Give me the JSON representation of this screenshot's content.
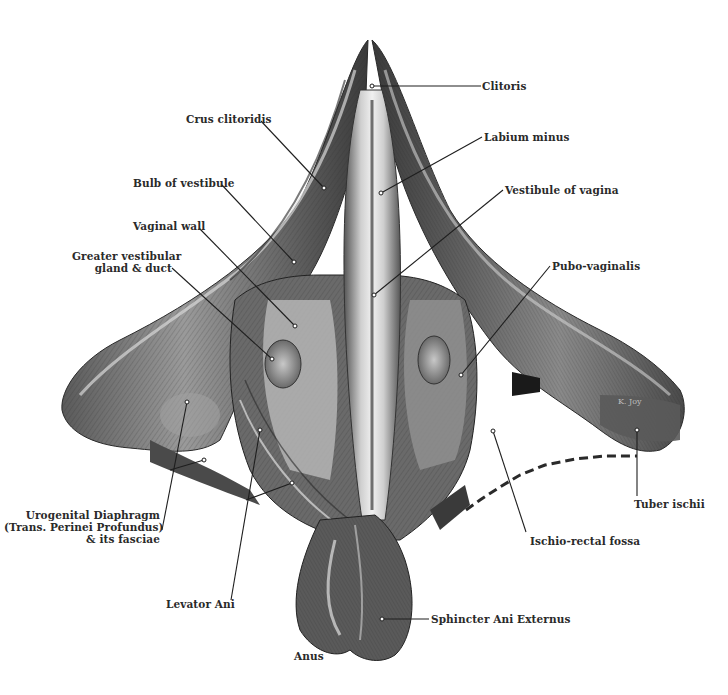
{
  "figure": {
    "colors": {
      "background": "#ffffff",
      "tissue_dark": "#3a3a3a",
      "tissue_mid": "#6e6e6e",
      "tissue_light": "#b8b8b8",
      "highlight": "#e8e8e8",
      "label_text": "#2a2a2a",
      "leader_line": "#1e1e1e"
    },
    "artist_signature": "K. Joy"
  },
  "labels": [
    {
      "id": "clitoris",
      "text": "Clitoris",
      "x": 482,
      "y": 80,
      "align": "left",
      "line": [
        [
          481,
          86
        ],
        [
          372,
          86
        ]
      ]
    },
    {
      "id": "crus-clitoridis",
      "text": "Crus clitoridis",
      "x": 186,
      "y": 113,
      "align": "left",
      "line": [
        [
          261,
          121
        ],
        [
          324,
          188
        ]
      ]
    },
    {
      "id": "labium-minus",
      "text": "Labium minus",
      "x": 484,
      "y": 131,
      "align": "left",
      "line": [
        [
          482,
          137
        ],
        [
          381,
          193
        ]
      ]
    },
    {
      "id": "vestibule-of-vagina",
      "text": "Vestibule of vagina",
      "x": 505,
      "y": 184,
      "align": "left",
      "line": [
        [
          503,
          190
        ],
        [
          374,
          295
        ]
      ]
    },
    {
      "id": "bulb-of-vestibule",
      "text": "Bulb of vestibule",
      "x": 133,
      "y": 177,
      "align": "left",
      "line": [
        [
          222,
          185
        ],
        [
          294,
          262
        ]
      ]
    },
    {
      "id": "vaginal-wall",
      "text": "Vaginal wall",
      "x": 133,
      "y": 220,
      "align": "left",
      "line": [
        [
          199,
          228
        ],
        [
          295,
          326
        ]
      ]
    },
    {
      "id": "greater-vestibular-gland",
      "text": "Greater vestibular\ngland & duct",
      "x": 77,
      "y": 250,
      "align": "right",
      "width": 95,
      "line": [
        [
          172,
          268
        ],
        [
          272,
          359
        ]
      ]
    },
    {
      "id": "pubo-vaginalis",
      "text": "Pubo-vaginalis",
      "x": 552,
      "y": 260,
      "align": "left",
      "line": [
        [
          550,
          266
        ],
        [
          461,
          375
        ]
      ]
    },
    {
      "id": "urogenital-diaphragm",
      "text": "Urogenital Diaphragm\n(Trans. Perinei Profundus)\n& its fasciae",
      "x": 8,
      "y": 509,
      "align": "right",
      "width": 152,
      "line": [
        [
          162,
          530
        ],
        [
          187,
          402
        ]
      ]
    },
    {
      "id": "tuber-ischii",
      "text": "Tuber ischii",
      "x": 634,
      "y": 498,
      "align": "left",
      "line": [
        [
          637,
          496
        ],
        [
          637,
          430
        ]
      ]
    },
    {
      "id": "ischio-rectal-fossa",
      "text": "Ischio-rectal fossa",
      "x": 530,
      "y": 535,
      "align": "left",
      "line": [
        [
          526,
          532
        ],
        [
          493,
          431
        ]
      ]
    },
    {
      "id": "levator-ani",
      "text": "Levator Ani",
      "x": 166,
      "y": 598,
      "align": "left",
      "line": [
        [
          231,
          600
        ],
        [
          260,
          430
        ]
      ]
    },
    {
      "id": "sphincter-ani-externus",
      "text": "Sphincter Ani Externus",
      "x": 431,
      "y": 615,
      "align": "left",
      "line": [
        [
          429,
          619
        ],
        [
          382,
          619
        ]
      ]
    },
    {
      "id": "anus",
      "text": "Anus",
      "x": 294,
      "y": 650,
      "align": "left",
      "line": null
    }
  ],
  "extra_leaders": [
    {
      "for": "urogenital-diaphragm",
      "line": [
        [
          170,
          470
        ],
        [
          204,
          460
        ]
      ]
    },
    {
      "for": "levator-ani",
      "line": [
        [
          246,
          500
        ],
        [
          292,
          483
        ]
      ]
    }
  ],
  "dashed_boundary": {
    "for": "ischio-rectal-fossa",
    "points": "466,510 480,500 500,487 520,475 545,465 575,459 605,456 637,456"
  }
}
